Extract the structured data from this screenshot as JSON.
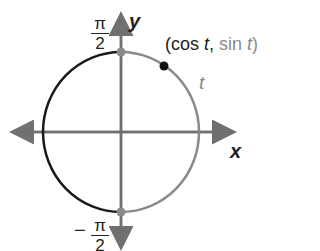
{
  "diagram": {
    "axes": {
      "x_label": "x",
      "y_label": "y"
    },
    "labels": {
      "point_open": "(",
      "point_cos": "cos ",
      "point_t1": "t",
      "point_comma": ", ",
      "point_sin": "sin ",
      "point_t2": "t",
      "point_close": ")",
      "arc_label": "t",
      "top_num": "π",
      "top_den": "2",
      "bottom_sign": "−",
      "bottom_num": "π",
      "bottom_den": "2"
    },
    "colors": {
      "axis": "#707070",
      "left_arc": "#1a1a1a",
      "right_arc": "#8a8a8a",
      "point": "#111111",
      "marker": "#8a8a8a",
      "gray_text": "#8a8a8a"
    }
  }
}
